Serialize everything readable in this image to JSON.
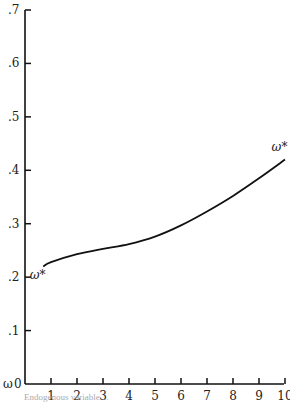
{
  "chart_data": {
    "type": "line",
    "title": "",
    "xlabel": "",
    "ylabel": "ω",
    "xlim": [
      0,
      10
    ],
    "ylim": [
      0,
      0.7
    ],
    "grid": false,
    "x_ticks": [
      "1",
      "2",
      "3",
      "4",
      "5",
      "6",
      "7",
      "8",
      "9",
      "10"
    ],
    "y_ticks": [
      "0",
      ".1",
      ".2",
      ".3",
      ".4",
      ".5",
      ".6",
      ".7"
    ],
    "series": [
      {
        "name": "ω*",
        "x": [
          0.7,
          1,
          2,
          3,
          4,
          5,
          6,
          7,
          8,
          9,
          10
        ],
        "values": [
          0.22,
          0.228,
          0.243,
          0.253,
          0.262,
          0.276,
          0.297,
          0.323,
          0.352,
          0.385,
          0.42
        ]
      }
    ],
    "annotations": [
      {
        "text": "ω*",
        "x": 0.3,
        "y": 0.2
      },
      {
        "text": "ω*",
        "x": 9.6,
        "y": 0.44
      }
    ]
  },
  "axis": {
    "y_label": "ω",
    "origin_label": "0"
  },
  "footnote": "Endogenous variable ..."
}
